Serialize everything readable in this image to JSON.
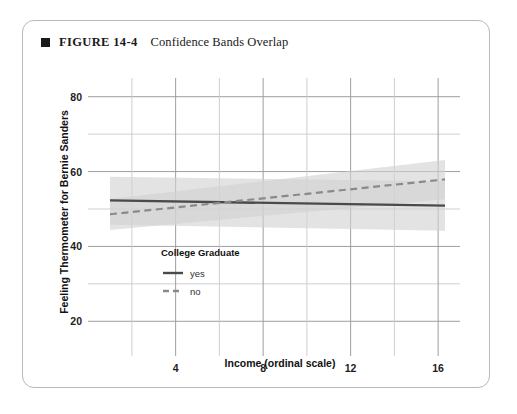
{
  "figure": {
    "bullet_icon": "filled-square-icon",
    "number_label": "FIGURE 14-4",
    "title": "Confidence Bands Overlap"
  },
  "chart_data": {
    "type": "line",
    "title": "Confidence Bands Overlap",
    "xlabel": "Income (ordinal scale)",
    "ylabel": "Feeling Thermometer for Bernie Sanders",
    "xlim": [
      1,
      17
    ],
    "ylim": [
      15,
      85
    ],
    "xticks": [
      4,
      8,
      12,
      16
    ],
    "xtick_labels": [
      "4",
      "8",
      "12",
      "16"
    ],
    "x_minor_ticks": [
      2,
      6,
      10,
      14
    ],
    "yticks": [
      20,
      40,
      60,
      80
    ],
    "ytick_labels": [
      "20",
      "40",
      "60",
      "80"
    ],
    "y_minor_ticks": [
      30,
      50,
      70
    ],
    "grid": true,
    "legend": {
      "title": "College Graduate",
      "position": "inside-lower-left",
      "entries": [
        {
          "label": "yes",
          "style": "solid",
          "color": "#4a4a4a"
        },
        {
          "label": "no",
          "style": "dashed",
          "color": "#8a8a8a"
        }
      ]
    },
    "x": [
      1,
      16
    ],
    "series": [
      {
        "name": "yes",
        "style": "solid",
        "color": "#4a4a4a",
        "values": [
          52.3,
          50.9
        ],
        "band_upper": [
          58.6,
          57.4
        ],
        "band_lower": [
          45.8,
          44.2
        ],
        "band_color": "#d2d2d2"
      },
      {
        "name": "no",
        "style": "dashed",
        "color": "#8a8a8a",
        "values": [
          48.6,
          57.9
        ],
        "band_upper": [
          52.7,
          63.1
        ],
        "band_lower": [
          44.4,
          52.6
        ],
        "band_color": "#d2d2d2"
      }
    ],
    "annotations": []
  }
}
